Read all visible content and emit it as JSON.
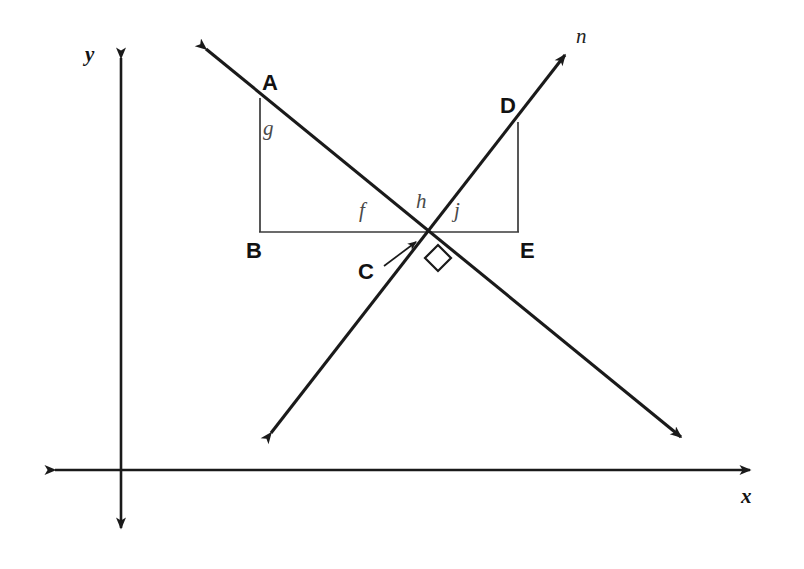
{
  "figure": {
    "background_color": "#ffffff",
    "stroke_color": "#1a1a1a",
    "label_color_vertex": "#121212",
    "label_color_angle": "#4a4a4a",
    "width": 804,
    "height": 569
  },
  "axes": {
    "x_label": "x",
    "y_label": "y",
    "x_axis": {
      "y": 470,
      "x_start": 43,
      "x_end": 762
    },
    "y_axis": {
      "x": 121,
      "y_start": 46,
      "y_end": 540
    }
  },
  "lines": [
    {
      "name": "m",
      "visible_label": "",
      "description": "double-headed arrow falling left-to-right",
      "from": {
        "x": 197,
        "y": 42
      },
      "to": {
        "x": 690,
        "y": 445
      }
    },
    {
      "name": "n",
      "visible_label": "n",
      "description": "double-headed arrow rising left-to-right",
      "from": {
        "x": 263,
        "y": 443
      },
      "to": {
        "x": 573,
        "y": 45
      }
    }
  ],
  "points": [
    {
      "label": "A",
      "x": 260,
      "y": 98
    },
    {
      "label": "B",
      "x": 260,
      "y": 232
    },
    {
      "label": "C",
      "x": 425,
      "y": 232
    },
    {
      "label": "D",
      "x": 518,
      "y": 122
    },
    {
      "label": "E",
      "x": 518,
      "y": 232
    }
  ],
  "segment_labels": [
    {
      "label": "g",
      "x": 268,
      "y": 130,
      "describes": "segment AB"
    },
    {
      "label": "f",
      "x": 364,
      "y": 212,
      "describes": "angle at C in triangle ABC"
    },
    {
      "label": "h",
      "x": 422,
      "y": 203,
      "describes": "angle between line m and line n above C"
    },
    {
      "label": "j",
      "x": 459,
      "y": 212,
      "describes": "angle at C in triangle CDE"
    }
  ],
  "markers": {
    "right_angle_at": "C",
    "right_angle_note": "small square marking perpendicular lines m and n",
    "callout_label": "C",
    "callout_from": {
      "x": 384,
      "y": 266
    },
    "callout_to": {
      "x": 414,
      "y": 240
    }
  },
  "labels": {
    "A": "A",
    "B": "B",
    "C": "C",
    "D": "D",
    "E": "E",
    "f": "f",
    "g": "g",
    "h": "h",
    "j": "j",
    "n": "n",
    "x": "x",
    "y": "y"
  }
}
